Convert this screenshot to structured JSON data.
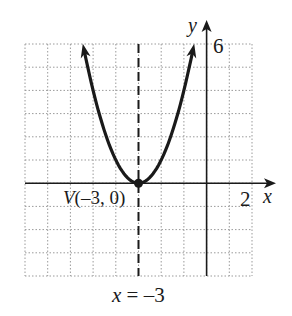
{
  "chart_data": {
    "type": "line",
    "title": "",
    "function": "y = (x + 3)^2",
    "xlabel": "x",
    "ylabel": "y",
    "xlim": [
      -8,
      2
    ],
    "ylim": [
      -4,
      6
    ],
    "grid": true,
    "grid_style": "dotted",
    "x_tick_labels": [
      {
        "value": 2,
        "label": "2"
      }
    ],
    "y_tick_labels": [
      {
        "value": 6,
        "label": "6"
      }
    ],
    "series": [
      {
        "name": "parabola",
        "x": [
          -5.4,
          -5,
          -4.5,
          -4,
          -3.5,
          -3,
          -2.5,
          -2,
          -1.5,
          -1,
          -0.6
        ],
        "y": [
          5.76,
          4,
          2.25,
          1,
          0.25,
          0,
          0.25,
          1,
          2.25,
          4,
          5.76
        ],
        "arrows_at_ends": true
      }
    ],
    "annotations": [
      {
        "type": "point",
        "x": -3,
        "y": 0,
        "label": "V(−3, 0)"
      },
      {
        "type": "vertical_dashed_line",
        "x": -3,
        "label": "x = −3"
      }
    ]
  },
  "labels": {
    "y_axis": "y",
    "x_axis": "x",
    "y_tick_6": "6",
    "x_tick_2": "2",
    "vertex": "V(–3, 0)",
    "axis_of_symmetry": "x = –3"
  }
}
